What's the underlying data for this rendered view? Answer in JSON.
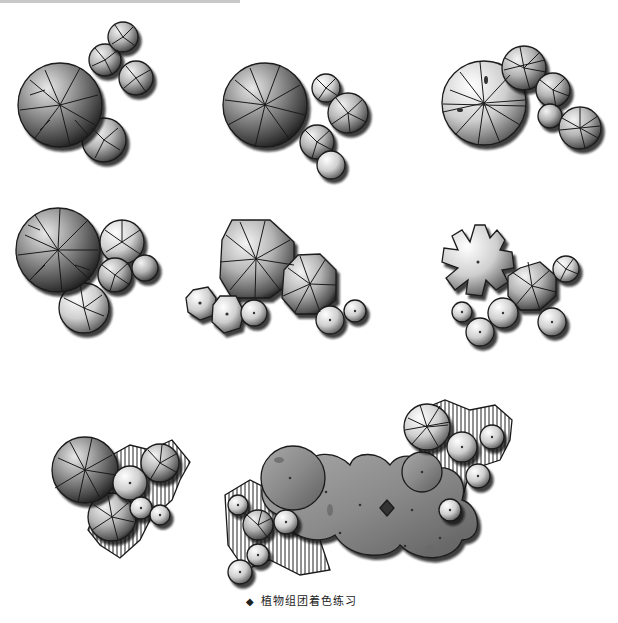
{
  "page": {
    "top_text_cutoff": "",
    "caption": {
      "bullet": "◆",
      "text": "植物组团着色练习"
    }
  },
  "illustrations": [
    {
      "id": "group-1",
      "label": "plant-group-radial-branch",
      "row": 1,
      "col": 1
    },
    {
      "id": "group-2",
      "label": "plant-group-branch-clusters",
      "row": 1,
      "col": 2
    },
    {
      "id": "group-3",
      "label": "plant-group-radial-spokes",
      "row": 1,
      "col": 3
    },
    {
      "id": "group-4",
      "label": "plant-group-dense-branch",
      "row": 2,
      "col": 1
    },
    {
      "id": "group-5",
      "label": "plant-group-octagon-shrubs",
      "row": 2,
      "col": 2
    },
    {
      "id": "group-6",
      "label": "plant-group-lobed-palm",
      "row": 2,
      "col": 3
    },
    {
      "id": "group-7",
      "label": "plant-group-with-groundcover",
      "row": 3,
      "col": 1
    },
    {
      "id": "group-8",
      "label": "plant-group-large-hedge-mass",
      "row": 3,
      "col": 2
    }
  ],
  "colors": {
    "ink": "#1a1a1a",
    "dark": "#3a3a3a",
    "mid": "#7a7a7a",
    "light": "#bdbdbd",
    "highlight": "#f0f0f0",
    "paper": "#ffffff"
  }
}
